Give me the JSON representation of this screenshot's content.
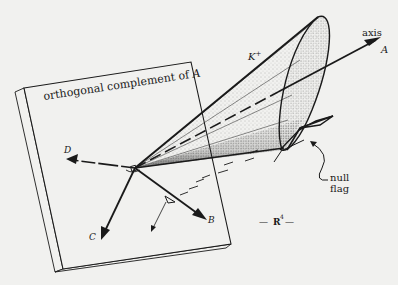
{
  "figure": {
    "background": "#f1f1ef",
    "ink": "#1a1a1a",
    "labels": {
      "plane": "orthogonal complement of",
      "plane_var": "A",
      "cone": "K",
      "cone_sup": "+",
      "axis_word": "axis",
      "axis_var": "A",
      "vector_b": "B",
      "vector_c": "C",
      "vector_d": "D",
      "null_flag_line1": "null",
      "null_flag_line2": "flag",
      "space": "R",
      "space_sup": "4",
      "space_dash_left": "—",
      "space_dash_right": "—"
    }
  }
}
